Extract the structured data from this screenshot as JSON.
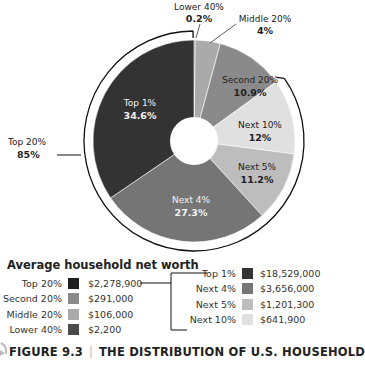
{
  "chart_data": {
    "type": "pie",
    "subtitle": "Average household net worth",
    "donut": true,
    "slices": [
      {
        "label": "Lower 40%",
        "value": 0.2,
        "display": "0.2%",
        "color": "#4a4a4a",
        "text_color": "#222"
      },
      {
        "label": "Middle 20%",
        "value": 4,
        "display": "4%",
        "color": "#aaaaaa",
        "text_color": "#222"
      },
      {
        "label": "Second 20%",
        "value": 10.9,
        "display": "10.9%",
        "color": "#8a8a8a",
        "text_color": "#222"
      },
      {
        "label": "Next 10%",
        "value": 12,
        "display": "12%",
        "color": "#e0e0e0",
        "text_color": "#222"
      },
      {
        "label": "Next 5%",
        "value": 11.2,
        "display": "11.2%",
        "color": "#bdbdbd",
        "text_color": "#222"
      },
      {
        "label": "Next 4%",
        "value": 27.3,
        "display": "27.3%",
        "color": "#757575",
        "text_color": "#f2f2f2"
      },
      {
        "label": "Top 1%",
        "value": 34.6,
        "display": "34.6%",
        "color": "#333333",
        "text_color": "#f2f2f2"
      }
    ],
    "group_annotation": {
      "label": "Top 20%",
      "value": "85%"
    },
    "legend": {
      "title": "Average household net worth",
      "left": [
        {
          "label": "Top 20%",
          "value": "$2,278,900",
          "color": "#1e1e1e"
        },
        {
          "label": "Second 20%",
          "value": "$291,000",
          "color": "#8a8a8a"
        },
        {
          "label": "Middle 20%",
          "value": "$106,000",
          "color": "#aaaaaa"
        },
        {
          "label": "Lower 40%",
          "value": "$2,200",
          "color": "#4a4a4a"
        }
      ],
      "right": [
        {
          "label": "Top 1%",
          "value": "$18,529,000",
          "color": "#333333"
        },
        {
          "label": "Next 4%",
          "value": "$3,656,000",
          "color": "#757575"
        },
        {
          "label": "Next 5%",
          "value": "$1,201,300",
          "color": "#bdbdbd"
        },
        {
          "label": "Next 10%",
          "value": "$641,900",
          "color": "#e0e0e0"
        }
      ]
    }
  },
  "caption": {
    "figure": "FIGURE 9.3",
    "separator": "|",
    "text": "THE DISTRIBUTION OF U.S. HOUSEHOLD"
  }
}
